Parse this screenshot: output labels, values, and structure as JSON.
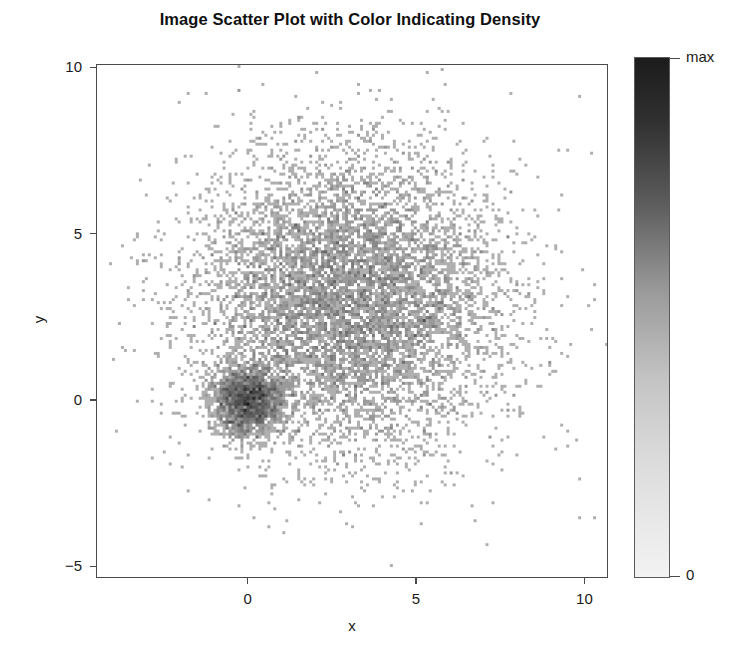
{
  "chart_data": {
    "type": "scatter",
    "title": "Image Scatter Plot with Color Indicating Density",
    "xlabel": "x",
    "ylabel": "y",
    "xlim": [
      -4.5,
      10.7
    ],
    "ylim": [
      -5.35,
      10.1
    ],
    "xticks": [
      0,
      5,
      10
    ],
    "xticklabels": [
      "0",
      "5",
      "10"
    ],
    "yticks": [
      -5,
      0,
      5,
      10
    ],
    "yticklabels": [
      "−5",
      "0",
      "5",
      "10"
    ],
    "grid": false,
    "colormap": "grayscale-reversed",
    "color_low_hex": "#f2f2f2",
    "color_high_hex": "#1c1c1c",
    "background_hex": "#ffffff",
    "frame_hex": "#4a4a4a",
    "pixel_bin_size_px": 3,
    "encoding": "pixel color encodes local point density",
    "colorbar": {
      "position": "right",
      "ticklabels": [
        "max",
        "0"
      ],
      "max_label": "max",
      "min_label": "0",
      "orientation": "vertical"
    },
    "series": [
      {
        "name": "dense-core-cluster",
        "distribution": "gaussian",
        "center": [
          0.0,
          0.0
        ],
        "sigma": [
          0.55,
          0.55
        ],
        "n_points": 2000,
        "peak_density_relative": 1.0
      },
      {
        "name": "diffuse-cloud-cluster",
        "distribution": "gaussian",
        "center": [
          3.0,
          3.1
        ],
        "sigma": [
          2.25,
          2.25
        ],
        "n_points": 8000,
        "peak_density_relative": 0.22
      }
    ]
  }
}
